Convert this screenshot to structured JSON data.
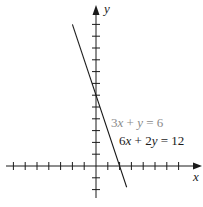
{
  "chart_data": {
    "type": "line",
    "title": "",
    "xlabel": "x",
    "ylabel": "y",
    "grid": false,
    "xlim": [
      -7,
      8.5
    ],
    "ylim": [
      -2,
      13
    ],
    "tick_spacing": 1,
    "x_ticks": [
      -7,
      -6,
      -5,
      -4,
      -3,
      -2,
      -1,
      1,
      2,
      3,
      4,
      5,
      6,
      7
    ],
    "y_ticks": [
      -2,
      -1,
      1,
      2,
      3,
      4,
      5,
      6,
      7,
      8,
      9,
      10,
      11,
      12
    ],
    "series": [
      {
        "name": "3x + y = 6 / 6x + 2y = 12 (same line)",
        "equation": "y = -3x + 6",
        "x": [
          -2,
          2.6
        ],
        "y": [
          12,
          -1.8
        ],
        "x_intercept": 2,
        "y_intercept": 6
      }
    ],
    "annotations": [
      {
        "text": "3x + y = 6",
        "color": "#8a8a8a"
      },
      {
        "text": "6x + 2y = 12",
        "color": "#1a1a1a"
      }
    ]
  },
  "labels": {
    "x_axis": "x",
    "y_axis": "y",
    "eq1": {
      "coef_x": "3",
      "var_x": "x",
      "op": " + ",
      "var_y": "y",
      "rhs": " = 6"
    },
    "eq2": {
      "coef_x": "6",
      "var_x": "x",
      "op": " + ",
      "coef_y": "2",
      "var_y": "y",
      "rhs": " = 12"
    }
  },
  "colors": {
    "axis": "#1a1a1a",
    "line": "#1a1a1a",
    "eq1_text": "#8a8a8a",
    "eq2_text": "#1a1a1a"
  }
}
